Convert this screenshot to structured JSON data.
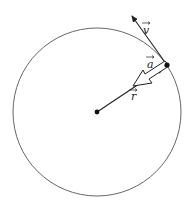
{
  "diagram": {
    "labels": {
      "velocity": "v",
      "acceleration": "a",
      "radius": "r"
    },
    "colors": {
      "stroke": "#222222",
      "circle": "#555555",
      "background": "#ffffff"
    },
    "geometry": {
      "center": [
        97,
        112
      ],
      "radius": 84,
      "point": [
        167,
        65
      ],
      "velocity_tip": [
        131,
        15
      ]
    }
  }
}
